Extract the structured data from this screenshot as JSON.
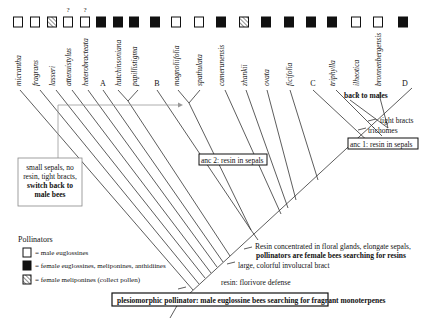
{
  "figure": {
    "taxa": [
      {
        "label": "micrantha",
        "pollinator": "male",
        "question": false,
        "x": 18
      },
      {
        "label": "fragrans",
        "pollinator": "male",
        "question": false,
        "x": 35
      },
      {
        "label": "lasseri",
        "pollinator": "hatched",
        "question": false,
        "x": 52
      },
      {
        "label": "attenuistylus",
        "pollinator": "male",
        "question": true,
        "x": 68
      },
      {
        "label": "heterobracteata",
        "pollinator": "male",
        "question": true,
        "x": 85
      },
      {
        "label": "A",
        "pollinator": "female",
        "question": false,
        "x": 101,
        "clade": true
      },
      {
        "label": "hutchinsoniana",
        "pollinator": "female",
        "question": false,
        "x": 118
      },
      {
        "label": "papillistigma",
        "pollinator": "female",
        "question": false,
        "x": 134
      },
      {
        "label": "B",
        "pollinator": "female",
        "question": false,
        "x": 155,
        "clade": true
      },
      {
        "label": "magnoliifolia",
        "pollinator": "male",
        "question": false,
        "x": 176
      },
      {
        "label": "spathulata",
        "pollinator": "male",
        "question": false,
        "x": 199
      },
      {
        "label": "camerunensis",
        "pollinator": "female",
        "question": false,
        "x": 221
      },
      {
        "label": "zhankii",
        "pollinator": "hatched",
        "question": false,
        "x": 244
      },
      {
        "label": "ovata",
        "pollinator": "female",
        "question": false,
        "x": 266
      },
      {
        "label": "ficifolia",
        "pollinator": "female",
        "question": false,
        "x": 289
      },
      {
        "label": "C",
        "pollinator": "female",
        "question": false,
        "x": 311,
        "clade": true
      },
      {
        "label": "triphylla",
        "pollinator": "female",
        "question": false,
        "x": 332
      },
      {
        "label": "ilheotica",
        "pollinator": "male",
        "question": false,
        "x": 356
      },
      {
        "label": "bronnenbergensis",
        "pollinator": "male",
        "question": false,
        "x": 378
      },
      {
        "label": "D",
        "pollinator": "female",
        "question": false,
        "x": 403,
        "clade": true
      }
    ],
    "question_mark": "?",
    "annotations": {
      "back_to_males": "back to males",
      "tight_bracts": "tight bracts",
      "trichomes": "trichomes",
      "anc1": "anc 1: resin in sepals",
      "anc2": "anc 2: resin in sepals",
      "small_sepals_line1": "small sepals, no",
      "small_sepals_line2": "resin, tight bracts,",
      "small_sepals_line3": "switch back to",
      "small_sepals_line4": "male bees",
      "resin_concentrated_line1": "Resin concentrated in floral glands, elongate sepals,",
      "resin_concentrated_line2": "pollinators are female bees searching for resins",
      "large_bract": "large, colorful involucral bract",
      "resin_defense": "resin: florivore defense",
      "plesiomorphic": "plesiomorphic pollinator: male euglossine bees searching for fragrant monoterpenes"
    },
    "legend": {
      "title": "Pollinators",
      "items": [
        {
          "symbol": "open-square",
          "label": "= male euglossines"
        },
        {
          "symbol": "filled-square",
          "label": "= female euglossines, meliponines, anthidiines"
        },
        {
          "symbol": "hatched-square",
          "label": "= female meliponines (collect pollen)"
        }
      ]
    },
    "colors": {
      "line": "#333333",
      "arrow_line": "#999999",
      "fill_black": "#111111",
      "fill_white": "#ffffff"
    }
  }
}
